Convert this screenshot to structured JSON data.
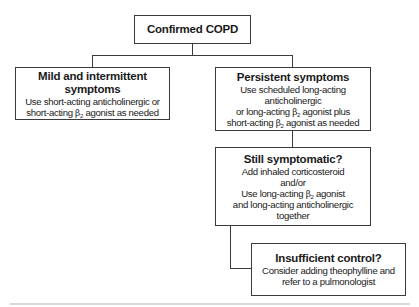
{
  "diagram": {
    "root": {
      "title": "Confirmed COPD"
    },
    "mild": {
      "title": "Mild and intermittent symptoms",
      "lines": [
        "Use short-acting anticholinergic or",
        "short-acting",
        "β",
        "2",
        "agonist as needed"
      ]
    },
    "persistent": {
      "title": "Persistent symptoms",
      "line1": "Use scheduled long-acting anticholinergic",
      "line2_pre": "or long-acting",
      "line2_post": "agonist plus",
      "line3_pre": "short-acting",
      "line3_post": "agonist as needed"
    },
    "still": {
      "title": "Still symptomatic?",
      "line1": "Add inhaled corticosteroid",
      "line2": "and/or",
      "line3_pre": "Use long-acting",
      "line3_post": "agonist",
      "line4": "and long-acting anticholinergic together"
    },
    "insufficient": {
      "title": "Insufficient control?",
      "line1": "Consider adding theophylline and",
      "line2": "refer to a pulmonologist"
    },
    "symbols": {
      "beta": "β",
      "sub2": "2"
    },
    "colors": {
      "stroke": "#3a3a3a",
      "background": "#ffffff",
      "rule": "#d9d9d9"
    }
  }
}
